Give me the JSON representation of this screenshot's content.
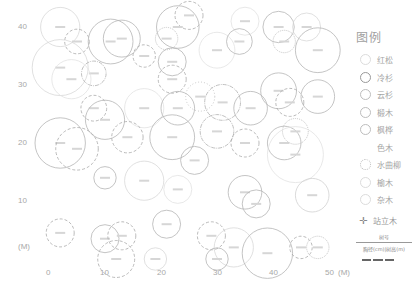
{
  "chart_data": {
    "type": "scatter",
    "title": "",
    "xlabel": "(M)",
    "ylabel": "(M)",
    "x_ticks": [
      "0",
      "10",
      "20",
      "30",
      "40",
      "50"
    ],
    "y_ticks": [
      "10",
      "20",
      "30",
      "40"
    ],
    "xlim": [
      0,
      50
    ],
    "ylim": [
      0,
      44
    ],
    "grid": false,
    "legend_position": "right",
    "points": [
      {
        "x": 2,
        "y": 40,
        "r": 3.5,
        "species": "红松"
      },
      {
        "x": 5,
        "y": 37.5,
        "r": 2.2,
        "species": "冷杉"
      },
      {
        "x": 11,
        "y": 37.5,
        "r": 4,
        "species": "云杉"
      },
      {
        "x": 13,
        "y": 38,
        "r": 3.3,
        "species": "云杉"
      },
      {
        "x": 2,
        "y": 33,
        "r": 5,
        "species": "红松"
      },
      {
        "x": 8,
        "y": 32,
        "r": 2.2,
        "species": "枫桦"
      },
      {
        "x": 4,
        "y": 31,
        "r": 3.5,
        "species": "色木"
      },
      {
        "x": 17,
        "y": 35,
        "r": 2,
        "species": "冷杉"
      },
      {
        "x": 22,
        "y": 34,
        "r": 2.5,
        "species": "云杉"
      },
      {
        "x": 22,
        "y": 31,
        "r": 2.5,
        "species": "冷杉"
      },
      {
        "x": 30,
        "y": 36,
        "r": 3.2,
        "species": "色木"
      },
      {
        "x": 25,
        "y": 42,
        "r": 2.5,
        "species": "冷杉"
      },
      {
        "x": 23,
        "y": 40,
        "r": 3.8,
        "species": "云杉"
      },
      {
        "x": 21,
        "y": 38,
        "r": 2,
        "species": "水曲柳"
      },
      {
        "x": 35,
        "y": 41,
        "r": 2.5,
        "species": "色木"
      },
      {
        "x": 34,
        "y": 37.5,
        "r": 2.3,
        "species": "云杉"
      },
      {
        "x": 41,
        "y": 40,
        "r": 2.8,
        "species": "云杉"
      },
      {
        "x": 42,
        "y": 37.5,
        "r": 2,
        "species": "水曲柳"
      },
      {
        "x": 46,
        "y": 40,
        "r": 2.5,
        "species": "红松"
      },
      {
        "x": 48,
        "y": 36,
        "r": 4,
        "species": "云杉"
      },
      {
        "x": 8,
        "y": 26,
        "r": 2.3,
        "species": "冷杉"
      },
      {
        "x": 10,
        "y": 24,
        "r": 3.5,
        "species": "云杉"
      },
      {
        "x": 17,
        "y": 26,
        "r": 3.5,
        "species": "色木"
      },
      {
        "x": 23,
        "y": 26,
        "r": 3,
        "species": "云杉"
      },
      {
        "x": 27,
        "y": 28,
        "r": 2.6,
        "species": "椴木"
      },
      {
        "x": 31,
        "y": 27,
        "r": 3.2,
        "species": "枫桦"
      },
      {
        "x": 36,
        "y": 26,
        "r": 3,
        "species": "云杉"
      },
      {
        "x": 41,
        "y": 29,
        "r": 3.2,
        "species": "云杉"
      },
      {
        "x": 43,
        "y": 27,
        "r": 2.5,
        "species": "冷杉"
      },
      {
        "x": 48,
        "y": 28,
        "r": 3,
        "species": "云杉"
      },
      {
        "x": 2,
        "y": 20,
        "r": 4.5,
        "species": "云杉"
      },
      {
        "x": 5,
        "y": 19,
        "r": 3.8,
        "species": "冷杉"
      },
      {
        "x": 14,
        "y": 21,
        "r": 2.8,
        "species": "冷杉"
      },
      {
        "x": 22,
        "y": 21,
        "r": 4,
        "species": "云杉"
      },
      {
        "x": 26,
        "y": 17,
        "r": 2.5,
        "species": "云杉"
      },
      {
        "x": 30,
        "y": 22,
        "r": 3,
        "species": "枫桦"
      },
      {
        "x": 35,
        "y": 20,
        "r": 2.5,
        "species": "冷杉"
      },
      {
        "x": 42,
        "y": 20,
        "r": 3,
        "species": "云杉"
      },
      {
        "x": 44,
        "y": 22,
        "r": 2.3,
        "species": "水曲柳"
      },
      {
        "x": 44,
        "y": 18,
        "r": 5,
        "species": "色木"
      },
      {
        "x": 10,
        "y": 14,
        "r": 2,
        "species": "云杉"
      },
      {
        "x": 17,
        "y": 13.5,
        "r": 3.5,
        "species": "红松"
      },
      {
        "x": 23,
        "y": 12,
        "r": 2.5,
        "species": "色木"
      },
      {
        "x": 35,
        "y": 11.5,
        "r": 3,
        "species": "云杉"
      },
      {
        "x": 37,
        "y": 9.5,
        "r": 2.5,
        "species": "云杉"
      },
      {
        "x": 47,
        "y": 11,
        "r": 3,
        "species": "杂木"
      },
      {
        "x": 2,
        "y": 4.5,
        "r": 2.5,
        "species": "冷杉"
      },
      {
        "x": 10,
        "y": 3.5,
        "r": 2.5,
        "species": "云杉"
      },
      {
        "x": 13,
        "y": 4,
        "r": 2.5,
        "species": "冷杉"
      },
      {
        "x": 21,
        "y": 6,
        "r": 2.5,
        "species": "云杉"
      },
      {
        "x": 29,
        "y": 4,
        "r": 2.5,
        "species": "冷杉"
      },
      {
        "x": 33,
        "y": 2,
        "r": 3.5,
        "species": "红松"
      },
      {
        "x": 39,
        "y": 1,
        "r": 4.5,
        "species": "云杉"
      },
      {
        "x": 45,
        "y": 2,
        "r": 2,
        "species": "冷杉"
      },
      {
        "x": 48,
        "y": 2,
        "r": 2,
        "species": "水曲柳"
      },
      {
        "x": 30,
        "y": 0,
        "r": 2,
        "species": "云杉"
      },
      {
        "x": 12,
        "y": 0,
        "r": 3.3,
        "species": "冷杉"
      },
      {
        "x": 19,
        "y": 0,
        "r": 2,
        "species": "红松"
      }
    ]
  },
  "axis": {
    "y_ticks": [
      {
        "label": "40",
        "top": 22
      },
      {
        "label": "30",
        "top": 80
      },
      {
        "label": "20",
        "top": 138
      },
      {
        "label": "10",
        "top": 196
      },
      {
        "label": "(M)",
        "top": 242
      }
    ],
    "x_ticks": [
      {
        "label": "0",
        "left": 46
      },
      {
        "label": "10",
        "left": 100
      },
      {
        "label": "20",
        "left": 157
      },
      {
        "label": "30",
        "left": 213
      },
      {
        "label": "40",
        "left": 269
      },
      {
        "label": "50",
        "left": 325
      },
      {
        "label": "(M)",
        "left": 338
      }
    ]
  },
  "legend": {
    "title": "图例",
    "items": [
      {
        "label": "红松",
        "style": "light"
      },
      {
        "label": "冷杉",
        "style": "dark"
      },
      {
        "label": "云杉",
        "style": "solid"
      },
      {
        "label": "椴木",
        "style": "solid"
      },
      {
        "label": "枫桦",
        "style": "solid"
      },
      {
        "label": "色木",
        "style": "none"
      },
      {
        "label": "水曲柳",
        "style": "dotted"
      },
      {
        "label": "榆木",
        "style": "light"
      },
      {
        "label": "杂木",
        "style": "light"
      }
    ],
    "standing_tree": {
      "symbol": "✛",
      "label": "站立木"
    },
    "scale_label_top": "树号",
    "scale_label_bottom": "胸径(cm)|树高(m)"
  }
}
